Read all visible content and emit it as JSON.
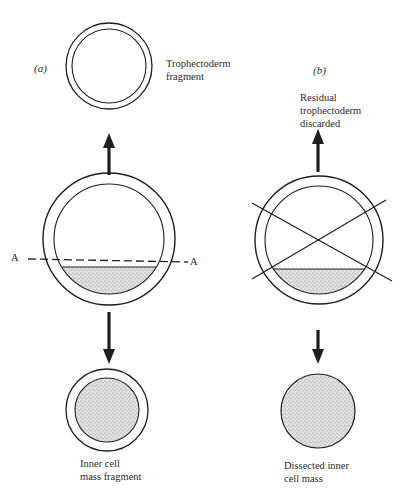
{
  "panels": {
    "a": {
      "label": "(a)",
      "top_label_line1": "Trophectoderm",
      "top_label_line2": "fragment",
      "cut_line_left": "A",
      "cut_line_right": "A",
      "bottom_label_line1": "Inner cell",
      "bottom_label_line2": "mass fragment"
    },
    "b": {
      "label": "(b)",
      "top_label_line1": "Residual",
      "top_label_line2": "trophectoderm",
      "top_label_line3": "discarded",
      "bottom_label_line1": "Dissected inner",
      "bottom_label_line2": "cell mass"
    }
  },
  "colors": {
    "stroke": "#1e1e1e",
    "stipple_fill": "#d6d6d6",
    "background": "#ffffff"
  }
}
